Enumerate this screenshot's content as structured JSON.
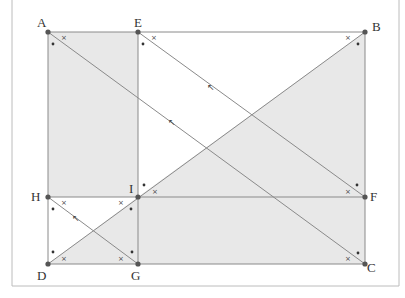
{
  "diagram": {
    "type": "geometry-figure",
    "colors": {
      "fill": "#e8e8e8",
      "line": "#8a8a8a",
      "point": "#555555",
      "frame": "#bcbcbc",
      "label": "#333333"
    },
    "points": {
      "A": {
        "label": "A",
        "x": 48,
        "y": 32
      },
      "E": {
        "label": "E",
        "x": 138,
        "y": 32
      },
      "B": {
        "label": "B",
        "x": 365,
        "y": 32
      },
      "H": {
        "label": "H",
        "x": 48,
        "y": 197
      },
      "I": {
        "label": "I",
        "x": 138,
        "y": 197
      },
      "F": {
        "label": "F",
        "x": 365,
        "y": 197
      },
      "D": {
        "label": "D",
        "x": 48,
        "y": 264
      },
      "G": {
        "label": "G",
        "x": 138,
        "y": 264
      },
      "C": {
        "label": "C",
        "x": 365,
        "y": 264
      }
    },
    "shaded_regions": [
      {
        "name": "rectangle AEIH",
        "vertices": [
          "A",
          "E",
          "I",
          "H"
        ]
      },
      {
        "name": "rectangle IFCG",
        "vertices": [
          "I",
          "F",
          "C",
          "G"
        ]
      },
      {
        "name": "triangle IBF",
        "vertices": [
          "I",
          "B",
          "F"
        ]
      },
      {
        "name": "triangle DGI",
        "vertices": [
          "D",
          "G",
          "I"
        ]
      }
    ],
    "segments": [
      [
        "A",
        "B"
      ],
      [
        "B",
        "C"
      ],
      [
        "C",
        "D"
      ],
      [
        "D",
        "A"
      ],
      [
        "E",
        "G"
      ],
      [
        "H",
        "F"
      ],
      [
        "A",
        "C"
      ],
      [
        "E",
        "F"
      ],
      [
        "H",
        "G"
      ],
      [
        "D",
        "B"
      ]
    ],
    "arrow_markers": [
      {
        "on": "AC",
        "glyph": "↖"
      },
      {
        "on": "EF",
        "glyph": "↖"
      },
      {
        "on": "HG",
        "glyph": "↖"
      }
    ],
    "angle_marks": {
      "cross": "×",
      "dot": "•"
    }
  }
}
